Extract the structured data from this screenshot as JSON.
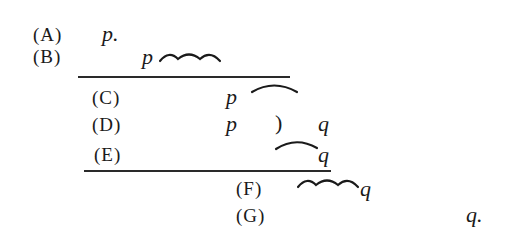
{
  "derivation": {
    "lines": [
      {
        "label": "(A)",
        "formula": "p.",
        "left_var": "p."
      },
      {
        "label": "(B)",
        "left_var": "p",
        "connective": "triple-tilde"
      },
      {
        "label": "(C)",
        "left_var": "p",
        "connective": "single-arc"
      },
      {
        "label": "(D)",
        "left_var": "p",
        "connective": "paren",
        "paren": ")",
        "right_var": "q"
      },
      {
        "label": "(E)",
        "connective": "single-arc",
        "right_var": "q"
      },
      {
        "label": "(F)",
        "connective": "triple-tilde",
        "right_var": "q"
      },
      {
        "label": "(G)",
        "right_var": "q."
      }
    ],
    "rules": [
      {
        "after": "(B)"
      },
      {
        "after": "(E)"
      }
    ]
  }
}
